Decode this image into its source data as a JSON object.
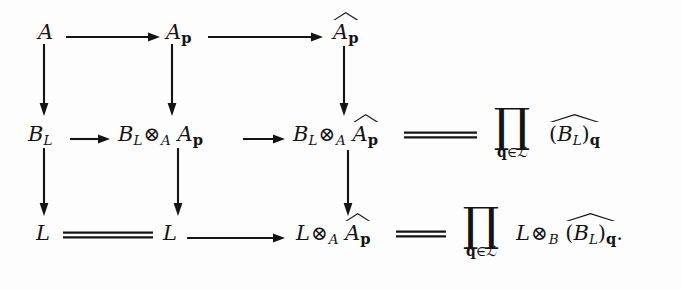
{
  "diagram": {
    "type": "commutative-diagram",
    "background_color": "#fdfdfd",
    "ink_color": "#141414",
    "rows": [
      {
        "id": "row-1",
        "nodes": [
          {
            "id": "n-A",
            "label": "A",
            "parts": {
              "base": "A"
            }
          },
          {
            "id": "n-Ap",
            "label": "A_p",
            "parts": {
              "base": "A",
              "sub": "p"
            }
          },
          {
            "id": "n-Ap-hat",
            "label": "hat(A_p)",
            "parts": {
              "base": "A",
              "sub": "p",
              "hat": true
            }
          }
        ]
      },
      {
        "id": "row-2",
        "nodes": [
          {
            "id": "n-BL",
            "label": "B_L",
            "parts": {
              "base": "B",
              "sub": "L"
            }
          },
          {
            "id": "n-BL-tns-Ap",
            "label": "B_L (x)_A A_p"
          },
          {
            "id": "n-BL-tns-Aphat",
            "label": "B_L (x)_A hat(A_p)"
          },
          {
            "id": "n-prod-BLq",
            "label": "prod_{q in L} hat((B_L)_q)"
          }
        ]
      },
      {
        "id": "row-3",
        "nodes": [
          {
            "id": "n-L1",
            "label": "L",
            "parts": {
              "base": "L"
            }
          },
          {
            "id": "n-L2",
            "label": "L",
            "parts": {
              "base": "L"
            }
          },
          {
            "id": "n-L-tns-Aphat",
            "label": "L (x)_A hat(A_p)"
          },
          {
            "id": "n-prod-L-tns-B-BLq",
            "label": "prod_{q in L} L (x)_B hat((B_L)_q)."
          }
        ]
      }
    ],
    "symbols": {
      "A": "A",
      "B": "B",
      "L": "L",
      "subscript_L": "L",
      "subscript_p": "p",
      "subscript_q": "q",
      "tensor": "⊗",
      "product": "∏",
      "element_of": "∈",
      "script_L": "ℒ",
      "open_paren": "(",
      "close_paren": ")",
      "period": "."
    },
    "product_subscript": {
      "index": "q",
      "relation": "∈",
      "set": "ℒ"
    },
    "arrows": [
      {
        "id": "arrow-A-to-Ap",
        "kind": "horizontal-arrow",
        "from": "n-A",
        "to": "n-Ap"
      },
      {
        "id": "arrow-Ap-to-Aphat",
        "kind": "horizontal-arrow",
        "from": "n-Ap",
        "to": "n-Ap-hat"
      },
      {
        "id": "arrow-A-to-BL",
        "kind": "vertical-arrow",
        "from": "n-A",
        "to": "n-BL"
      },
      {
        "id": "arrow-Ap-to-BLtnsAp",
        "kind": "vertical-arrow",
        "from": "n-Ap",
        "to": "n-BL-tns-Ap"
      },
      {
        "id": "arrow-Aphat-to-BLtnsAphat",
        "kind": "vertical-arrow",
        "from": "n-Ap-hat",
        "to": "n-BL-tns-Aphat"
      },
      {
        "id": "arrow-BL-to-BLtnsAp",
        "kind": "horizontal-arrow",
        "from": "n-BL",
        "to": "n-BL-tns-Ap"
      },
      {
        "id": "arrow-BLtnsAp-to-BLtnsAphat",
        "kind": "horizontal-arrow",
        "from": "n-BL-tns-Ap",
        "to": "n-BL-tns-Aphat"
      },
      {
        "id": "equals-BLtnsAphat-prod",
        "kind": "double-line-equality",
        "from": "n-BL-tns-Aphat",
        "to": "n-prod-BLq"
      },
      {
        "id": "arrow-BL-to-L1",
        "kind": "vertical-arrow",
        "from": "n-BL",
        "to": "n-L1"
      },
      {
        "id": "arrow-BLtnsAp-to-L2",
        "kind": "vertical-arrow",
        "from": "n-BL-tns-Ap",
        "to": "n-L2"
      },
      {
        "id": "arrow-BLtnsAphat-to-LtnsAphat",
        "kind": "vertical-arrow",
        "from": "n-BL-tns-Aphat",
        "to": "n-L-tns-Aphat"
      },
      {
        "id": "equals-L1-L2",
        "kind": "double-line-equality",
        "from": "n-L1",
        "to": "n-L2"
      },
      {
        "id": "arrow-L2-to-LtnsAphat",
        "kind": "horizontal-arrow",
        "from": "n-L2",
        "to": "n-L-tns-Aphat"
      },
      {
        "id": "equals-LtnsAphat-prod",
        "kind": "double-line-equality",
        "from": "n-L-tns-Aphat",
        "to": "n-prod-L-tns-B-BLq"
      }
    ]
  }
}
